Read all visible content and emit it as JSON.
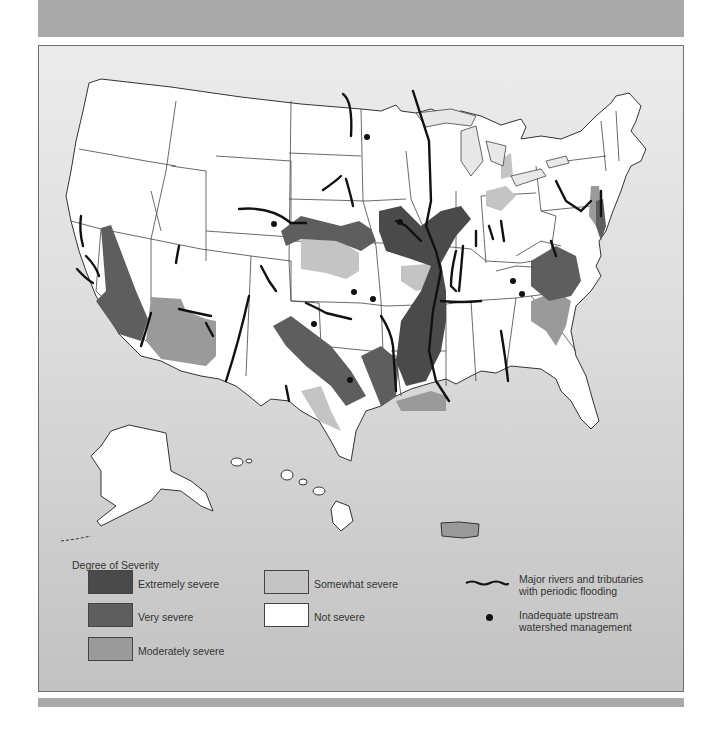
{
  "colors": {
    "extremely_severe": "#4a4a4a",
    "very_severe": "#5e5e5e",
    "moderately_severe": "#9a9a9a",
    "somewhat_severe": "#c4c4c4",
    "not_severe": "#ffffff",
    "river": "#111111",
    "dot": "#111111",
    "background_top": "#ececec",
    "background_bottom": "#c2c2c2"
  },
  "legend": {
    "title": "Degree of Severity",
    "severity_items": [
      {
        "label": "Extremely severe",
        "color": "#4a4a4a"
      },
      {
        "label": "Very severe",
        "color": "#5e5e5e"
      },
      {
        "label": "Moderately severe",
        "color": "#9a9a9a"
      },
      {
        "label": "Somewhat severe",
        "color": "#c4c4c4"
      },
      {
        "label": "Not severe",
        "color": "#ffffff"
      }
    ],
    "symbols": [
      {
        "symbol": "wavy-line",
        "label_line1": "Major rivers and tributaries",
        "label_line2": "with periodic flooding"
      },
      {
        "symbol": "dot",
        "label_line1": "Inadequate upstream",
        "label_line2": "watershed management"
      }
    ]
  },
  "regions_shown": [
    "Contiguous United States",
    "Alaska",
    "Hawaii",
    "Puerto Rico"
  ]
}
